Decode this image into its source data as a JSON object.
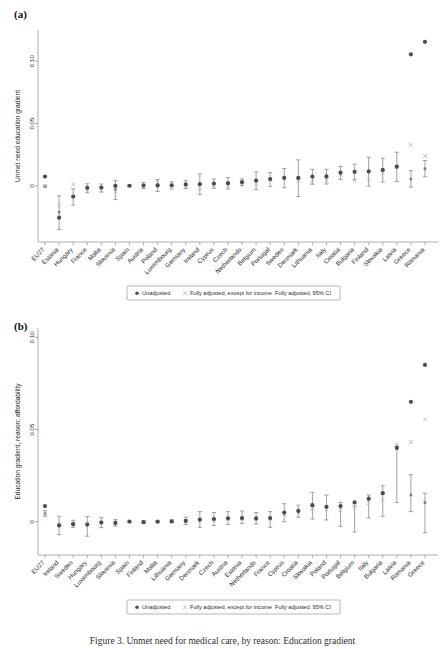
{
  "figure": {
    "caption": "Figure 3. Unmet need for medical care, by reason: Education gradient"
  },
  "legend": {
    "items": [
      {
        "marker": "filled-circle-marker",
        "label": "Unadjusted"
      },
      {
        "marker": "cross-marker",
        "label": "Fully adjusted, except for income"
      },
      {
        "marker": "ci-bar-marker",
        "label": "Fully adjusted, 95% CI"
      }
    ]
  },
  "colors": {
    "unadjusted": "#4d4d4d",
    "partially_adjusted": "#b5b5b5",
    "fully_adjusted": "#6e6e6e",
    "ci": "#8a8a8a",
    "axis": "#8c8c8c"
  },
  "panels": [
    {
      "key": "a",
      "label": "(a)",
      "ylabel": "Unmet need education gradient"
    },
    {
      "key": "b",
      "label": "(b)",
      "ylabel": "Education gradient, reason: affordability"
    }
  ],
  "chart_data": [
    {
      "type": "scatter",
      "panel": "(a)",
      "title": "",
      "xlabel": "",
      "ylabel": "Unmet need education gradient",
      "ylim": [
        -0.045,
        0.125
      ],
      "yticks": [
        0,
        0.05,
        0.1
      ],
      "ytick_labels": [
        "0",
        "0.05",
        "0.10"
      ],
      "grid": false,
      "legend_position": "below-axes",
      "categories": [
        "EU27",
        "Estonia",
        "Hungary",
        "France",
        "Malta",
        "Slovenia",
        "Spain",
        "Austria",
        "Poland",
        "Luxembourg",
        "Germany",
        "Ireland",
        "Cyprus",
        "Czech",
        "Netherlands",
        "Belgium",
        "Portugal",
        "Sweden",
        "Denmark",
        "Lithuania",
        "Italy",
        "Croatia",
        "Bulgaria",
        "Finland",
        "Slovakia",
        "Latvia",
        "Greece",
        "Romania"
      ],
      "series": [
        {
          "name": "Unadjusted",
          "marker": "filled-circle",
          "values": [
            0.0075,
            -0.0255,
            -0.0085,
            -0.0015,
            -0.0013,
            0.0,
            0.0001,
            0.0003,
            0.0004,
            0.0005,
            0.0012,
            0.0014,
            0.0019,
            0.0022,
            0.003,
            0.0043,
            0.0055,
            0.0065,
            0.0064,
            0.0075,
            0.0076,
            0.0106,
            0.0113,
            0.0116,
            0.0128,
            0.0155,
            0.1055,
            0.1155
          ]
        },
        {
          "name": "Fully adjusted, except for income",
          "marker": "cross",
          "values": [
            -0.0002,
            -0.0155,
            0.0013,
            -0.0038,
            -0.0032,
            -0.0042,
            0.0001,
            0.0,
            0.0025,
            0.0003,
            0.0,
            -0.0026,
            0.0005,
            0.0,
            0.0015,
            0.002,
            0.0051,
            0.0058,
            0.004,
            0.003,
            0.0043,
            0.009,
            0.004,
            0.0055,
            0.0105,
            0.015,
            0.033,
            0.024
          ]
        },
        {
          "name": "Fully adjusted, 95% CI",
          "marker": "ci-bar",
          "values": [
            -0.0002,
            -0.021,
            -0.0088,
            -0.002,
            -0.0018,
            -0.003,
            0.0001,
            0.0002,
            0.0004,
            0.0004,
            0.0011,
            0.0013,
            0.0018,
            0.0021,
            0.0029,
            0.0041,
            0.005,
            0.0062,
            0.0062,
            0.0073,
            0.0074,
            0.0104,
            0.0112,
            0.0114,
            0.0126,
            0.0152,
            0.0056,
            0.0138
          ],
          "ci_low": [
            -0.001,
            -0.035,
            -0.0155,
            -0.0055,
            -0.005,
            -0.011,
            -0.0004,
            -0.0022,
            -0.0045,
            -0.0025,
            -0.0022,
            -0.007,
            -0.002,
            -0.0025,
            0.0002,
            -0.003,
            -0.0006,
            -0.0015,
            -0.0085,
            0.0013,
            0.0015,
            0.0052,
            0.005,
            -0.0002,
            0.003,
            0.0035,
            -0.001,
            0.0073
          ],
          "ci_high": [
            0.0006,
            -0.008,
            -0.0023,
            0.0017,
            0.0015,
            0.0044,
            0.0006,
            0.0026,
            0.0052,
            0.0033,
            0.0044,
            0.0096,
            0.0056,
            0.0067,
            0.0056,
            0.0112,
            0.0106,
            0.0139,
            0.0209,
            0.0133,
            0.0133,
            0.0156,
            0.0174,
            0.023,
            0.0222,
            0.027,
            0.0122,
            0.0203
          ]
        }
      ]
    },
    {
      "type": "scatter",
      "panel": "(b)",
      "title": "",
      "xlabel": "",
      "ylabel": "Education gradient, reason: affordability",
      "ylim": [
        -0.018,
        0.105
      ],
      "yticks": [
        0,
        0.05,
        0.1
      ],
      "ytick_labels": [
        "0",
        "0.05",
        "0.10"
      ],
      "grid": false,
      "legend_position": "below-axes",
      "categories": [
        "EU27",
        "Ireland",
        "Sweden",
        "Hungary",
        "Luxembourg",
        "Slovenia",
        "Spain",
        "Finland",
        "Malta",
        "Lithuania",
        "Germany",
        "Denmark",
        "Czech",
        "Austria",
        "Estonia",
        "Netherlands",
        "France",
        "Cyprus",
        "Croatia",
        "Slovakia",
        "Poland",
        "Portugal",
        "Belgium",
        "Italy",
        "Bulgaria",
        "Latvia",
        "Romania",
        "Greece"
      ],
      "series": [
        {
          "name": "Unadjusted",
          "marker": "filled-circle",
          "values": [
            0.0085,
            -0.002,
            -0.0013,
            -0.0015,
            -0.0004,
            -0.0006,
            0.0001,
            -0.0002,
            0.0001,
            0.0002,
            0.0005,
            0.0012,
            0.0015,
            0.0019,
            0.002,
            0.0018,
            0.002,
            0.005,
            0.0059,
            0.009,
            0.0081,
            0.0085,
            0.0105,
            0.0125,
            0.0155,
            0.04,
            0.065,
            0.085
          ]
        },
        {
          "name": "Fully adjusted, except for income",
          "marker": "cross",
          "values": [
            0.0045,
            -0.0016,
            -0.001,
            -0.0011,
            -0.0002,
            -0.0004,
            0.0001,
            -0.0001,
            0.0001,
            0.0002,
            0.0003,
            0.0008,
            0.0011,
            0.0014,
            0.0016,
            0.0014,
            0.0016,
            0.004,
            0.0048,
            0.007,
            0.0068,
            0.0062,
            0.008,
            0.01,
            0.0115,
            0.0418,
            0.0432,
            0.0555
          ]
        },
        {
          "name": "Fully adjusted, 95% CI",
          "marker": "ci-bar",
          "values": [
            0.0045,
            -0.0022,
            -0.0014,
            -0.0016,
            -0.0005,
            -0.0007,
            0.0001,
            -0.0002,
            0.0,
            0.0001,
            0.0004,
            0.0011,
            0.0014,
            0.0018,
            0.0019,
            0.0017,
            0.0019,
            0.0048,
            0.0057,
            0.0088,
            0.0079,
            0.0083,
            0.0103,
            0.0123,
            0.0153,
            0.0398,
            0.0145,
            0.0105
          ],
          "ci_low": [
            0.003,
            -0.007,
            -0.003,
            -0.0078,
            -0.0032,
            -0.0023,
            -0.0002,
            -0.0007,
            -0.0003,
            -0.0004,
            -0.0015,
            -0.003,
            -0.002,
            -0.0015,
            -0.001,
            -0.0012,
            -0.003,
            0.0,
            0.0025,
            0.0015,
            0.001,
            -0.0025,
            -0.0055,
            0.002,
            0.003,
            0.0105,
            0.0055,
            -0.006
          ],
          "ci_high": [
            0.006,
            0.003,
            0.0008,
            0.0028,
            0.0022,
            0.0012,
            0.0003,
            0.0006,
            0.0004,
            0.001,
            0.0025,
            0.0055,
            0.005,
            0.0055,
            0.0058,
            0.005,
            0.0055,
            0.0098,
            0.009,
            0.016,
            0.0145,
            0.0105,
            0.0085,
            0.0145,
            0.0195,
            0.041,
            0.0255,
            0.0155
          ]
        }
      ]
    }
  ]
}
